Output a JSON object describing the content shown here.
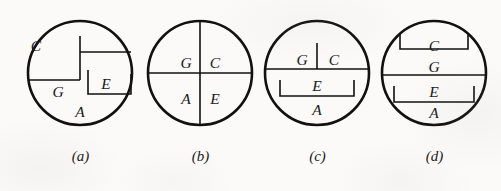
{
  "figure": {
    "background_color": "#fbfaf8",
    "ink_color": "#111111",
    "panel_count": 4,
    "panels": [
      {
        "id": "a",
        "caption": "(a)",
        "labels": [
          {
            "name": "C",
            "text": "C",
            "x": 78,
            "y": 28
          },
          {
            "name": "G",
            "text": "G",
            "x": 36,
            "y": 56
          },
          {
            "name": "E",
            "text": "E",
            "x": 84,
            "y": 66
          },
          {
            "name": "A",
            "text": "A",
            "x": 60,
            "y": 93
          }
        ]
      },
      {
        "id": "b",
        "caption": "(b)",
        "labels": [
          {
            "name": "G",
            "text": "G",
            "x": 50,
            "y": 45
          },
          {
            "name": "C",
            "text": "C",
            "x": 74,
            "y": 45
          },
          {
            "name": "A",
            "text": "A",
            "x": 50,
            "y": 82
          },
          {
            "name": "E",
            "text": "E",
            "x": 74,
            "y": 82
          }
        ]
      },
      {
        "id": "c",
        "caption": "(c)",
        "labels": [
          {
            "name": "G",
            "text": "G",
            "x": 49,
            "y": 42
          },
          {
            "name": "C",
            "text": "C",
            "x": 76,
            "y": 42
          },
          {
            "name": "E",
            "text": "E",
            "x": 62,
            "y": 67
          },
          {
            "name": "A",
            "text": "A",
            "x": 62,
            "y": 90
          }
        ]
      },
      {
        "id": "d",
        "caption": "(d)",
        "labels": [
          {
            "name": "C",
            "text": "C",
            "x": 62,
            "y": 31
          },
          {
            "name": "G",
            "text": "G",
            "x": 62,
            "y": 51
          },
          {
            "name": "E",
            "text": "E",
            "x": 62,
            "y": 73
          },
          {
            "name": "A",
            "text": "A",
            "x": 62,
            "y": 94
          }
        ]
      }
    ]
  }
}
